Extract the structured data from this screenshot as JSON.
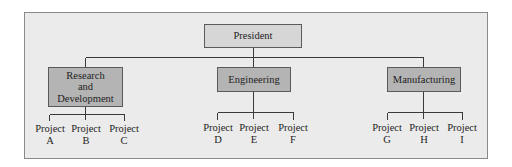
{
  "diagram": {
    "type": "org-chart",
    "root": {
      "label": "President"
    },
    "departments": [
      {
        "label_lines": [
          "Research",
          "and",
          "Development"
        ],
        "projects": [
          {
            "line1": "Project",
            "line2": "A"
          },
          {
            "line1": "Project",
            "line2": "B"
          },
          {
            "line1": "Project",
            "line2": "C"
          }
        ]
      },
      {
        "label_lines": [
          "Engineering"
        ],
        "projects": [
          {
            "line1": "Project",
            "line2": "D"
          },
          {
            "line1": "Project",
            "line2": "E"
          },
          {
            "line1": "Project",
            "line2": "F"
          }
        ]
      },
      {
        "label_lines": [
          "Manufacturing"
        ],
        "projects": [
          {
            "line1": "Project",
            "line2": "G"
          },
          {
            "line1": "Project",
            "line2": "H"
          },
          {
            "line1": "Project",
            "line2": "I"
          }
        ]
      }
    ],
    "colors": {
      "frame_bg": "#ebebeb",
      "root_box_fill": "#d6d6d6",
      "dept_box_fill": "#b4b4b4",
      "line": "#3a3a3a"
    }
  }
}
